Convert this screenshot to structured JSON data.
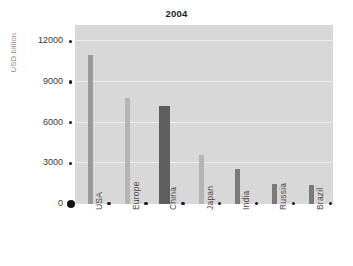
{
  "chart_data": {
    "type": "bar",
    "title": "2004",
    "xlabel": "",
    "ylabel": "USD billion",
    "categories": [
      "USA",
      "Europe",
      "China",
      "Japan",
      "India",
      "Russia",
      "Brazil"
    ],
    "values": [
      11000,
      7850,
      7200,
      3600,
      2600,
      1500,
      1400
    ],
    "bar_colors": [
      "#9a9a9a",
      "#b4b4b4",
      "#5e5e5e",
      "#b4b4b4",
      "#7a7a7a",
      "#7a7a7a",
      "#7a7a7a"
    ],
    "ylim": [
      0,
      13200
    ],
    "yticks": [
      0,
      3000,
      6000,
      9000,
      12000
    ],
    "ytick_labels": [
      "0",
      "3000",
      "6000",
      "9000",
      "12000"
    ],
    "grid": true,
    "grid_color": "#eeeeee",
    "plot_background": "#d8d8d8",
    "legend": null,
    "legend_position": "none"
  },
  "page": {
    "title": "2004",
    "axis_label_y": "USD billion",
    "side_note": ""
  }
}
